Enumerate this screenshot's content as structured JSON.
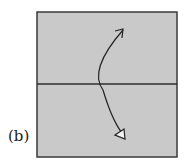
{
  "figure": {
    "label": "(b)",
    "paper_color": "#c9c9c9",
    "line_color": "#333333",
    "elements": {
      "paper": "square-paper",
      "crease": "horizontal-center-crease",
      "arrow": "curved-fold-arrow",
      "arrow_tip_top": "open-arrowhead",
      "arrow_tip_bottom": "hollow-triangle-arrowhead"
    }
  }
}
